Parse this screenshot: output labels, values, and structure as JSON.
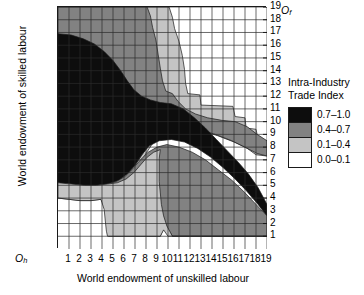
{
  "chart_data": {
    "type": "heatmap",
    "title": "",
    "xlabel": "World endowment of unskilled labour",
    "ylabel": "World endowment of skilled labour",
    "xlim": [
      0,
      19
    ],
    "ylim": [
      0,
      19
    ],
    "xticks": [
      "1",
      "2",
      "3",
      "4",
      "5",
      "6",
      "7",
      "8",
      "9",
      "10",
      "11",
      "12",
      "13",
      "14",
      "15",
      "16",
      "17",
      "18",
      "19"
    ],
    "yticks": [
      "1",
      "2",
      "3",
      "4",
      "5",
      "6",
      "7",
      "8",
      "9",
      "10",
      "11",
      "12",
      "13",
      "14",
      "15",
      "16",
      "17",
      "18",
      "19"
    ],
    "grid": true,
    "origin_left_label": "O",
    "origin_left_sub": "h",
    "origin_right_label": "O",
    "origin_right_sub": "f",
    "legend": {
      "title_line1": "Intra-Industry",
      "title_line2": "Trade Index",
      "position": "right",
      "entries": [
        {
          "label": "0.7–1.0",
          "color": "#0d0d0d"
        },
        {
          "label": "0.4–0.7",
          "color": "#828282"
        },
        {
          "label": "0.1–0.4",
          "color": "#c4c4c4"
        },
        {
          "label": "0.0–0.1",
          "color": "#ffffff"
        }
      ]
    },
    "bands": [
      {
        "name": "band-0.1-0.4-upper",
        "level": "0.1-0.4",
        "color": "#c4c4c4",
        "points": [
          [
            0,
            19
          ],
          [
            10.1,
            19
          ],
          [
            10.4,
            18.2
          ],
          [
            10.6,
            17.3
          ],
          [
            11.0,
            16.3
          ],
          [
            11.3,
            15.2
          ],
          [
            11.5,
            14.1
          ],
          [
            11.6,
            13.0
          ],
          [
            11.8,
            12.2
          ],
          [
            12.9,
            12.1
          ],
          [
            13.0,
            11.3
          ],
          [
            15.9,
            11.2
          ],
          [
            16.1,
            10.4
          ],
          [
            17.0,
            10.3
          ],
          [
            17.1,
            9.5
          ],
          [
            18.0,
            9.4
          ],
          [
            18.2,
            8.6
          ],
          [
            19,
            8.5
          ],
          [
            19,
            7.3
          ],
          [
            18.0,
            7.4
          ],
          [
            17.2,
            7.9
          ],
          [
            16.0,
            8.4
          ],
          [
            14.5,
            8.9
          ],
          [
            13.0,
            9.3
          ],
          [
            11.5,
            9.5
          ],
          [
            10.2,
            9.3
          ],
          [
            9.3,
            8.9
          ],
          [
            8.6,
            8.3
          ],
          [
            8.0,
            7.5
          ],
          [
            7.4,
            6.6
          ],
          [
            6.7,
            5.9
          ],
          [
            5.9,
            5.4
          ],
          [
            5.0,
            5.1
          ],
          [
            4.0,
            5.0
          ],
          [
            3.0,
            5.0
          ],
          [
            2.0,
            5.1
          ],
          [
            1.0,
            5.2
          ],
          [
            0,
            5.3
          ]
        ]
      },
      {
        "name": "band-0.4-0.7-upper",
        "level": "0.4-0.7",
        "color": "#828282",
        "points": [
          [
            0,
            19
          ],
          [
            8.1,
            19
          ],
          [
            8.4,
            18.3
          ],
          [
            8.6,
            17.4
          ],
          [
            8.9,
            16.4
          ],
          [
            9.1,
            15.3
          ],
          [
            9.3,
            14.2
          ],
          [
            9.5,
            13.2
          ],
          [
            9.8,
            12.4
          ],
          [
            10.4,
            12.2
          ],
          [
            10.9,
            11.6
          ],
          [
            11.6,
            11.0
          ],
          [
            12.5,
            10.6
          ],
          [
            13.6,
            10.3
          ],
          [
            14.9,
            10.1
          ],
          [
            16.1,
            10.0
          ],
          [
            17.2,
            9.6
          ],
          [
            18.1,
            9.0
          ],
          [
            19,
            8.5
          ],
          [
            19,
            7.3
          ],
          [
            18.1,
            7.5
          ],
          [
            17.0,
            8.0
          ],
          [
            15.8,
            8.5
          ],
          [
            14.3,
            9.0
          ],
          [
            12.8,
            9.4
          ],
          [
            11.4,
            9.6
          ],
          [
            10.1,
            9.4
          ],
          [
            9.2,
            9.0
          ],
          [
            8.4,
            8.4
          ],
          [
            7.8,
            7.6
          ],
          [
            7.1,
            6.7
          ],
          [
            6.4,
            6.0
          ],
          [
            5.6,
            5.5
          ],
          [
            4.7,
            5.2
          ],
          [
            3.7,
            5.1
          ],
          [
            2.6,
            5.1
          ],
          [
            1.4,
            5.2
          ],
          [
            0,
            5.4
          ]
        ]
      },
      {
        "name": "band-0.7-1.0-black",
        "level": "0.7-1.0",
        "color": "#0d0d0d",
        "points": [
          [
            0,
            16.9
          ],
          [
            1.2,
            16.8
          ],
          [
            2.3,
            16.5
          ],
          [
            3.3,
            16.1
          ],
          [
            4.2,
            15.5
          ],
          [
            5.0,
            14.8
          ],
          [
            5.7,
            14.0
          ],
          [
            6.3,
            13.2
          ],
          [
            6.9,
            12.5
          ],
          [
            7.6,
            12.0
          ],
          [
            8.4,
            11.7
          ],
          [
            9.3,
            11.5
          ],
          [
            10.3,
            11.4
          ],
          [
            11.4,
            11.0
          ],
          [
            12.4,
            10.3
          ],
          [
            13.4,
            9.5
          ],
          [
            14.4,
            8.6
          ],
          [
            15.4,
            7.7
          ],
          [
            16.4,
            6.8
          ],
          [
            17.3,
            5.9
          ],
          [
            18.2,
            4.8
          ],
          [
            19,
            3.5
          ],
          [
            19,
            2.6
          ],
          [
            18.1,
            3.6
          ],
          [
            17.1,
            4.6
          ],
          [
            16.1,
            5.5
          ],
          [
            15.0,
            6.4
          ],
          [
            13.9,
            7.2
          ],
          [
            12.7,
            7.9
          ],
          [
            11.5,
            8.4
          ],
          [
            10.3,
            8.6
          ],
          [
            9.2,
            8.5
          ],
          [
            8.3,
            8.1
          ],
          [
            7.6,
            7.4
          ],
          [
            7.0,
            6.6
          ],
          [
            6.3,
            5.9
          ],
          [
            5.5,
            5.4
          ],
          [
            4.6,
            5.1
          ],
          [
            3.6,
            5.0
          ],
          [
            2.5,
            5.0
          ],
          [
            1.3,
            5.1
          ],
          [
            0,
            5.2
          ]
        ]
      },
      {
        "name": "band-0.4-0.7-lower",
        "level": "0.4-0.7",
        "color": "#828282",
        "points": [
          [
            19,
            2.6
          ],
          [
            18.0,
            3.5
          ],
          [
            16.9,
            4.5
          ],
          [
            15.8,
            5.4
          ],
          [
            14.6,
            6.2
          ],
          [
            13.4,
            7.0
          ],
          [
            12.2,
            7.6
          ],
          [
            11.0,
            8.0
          ],
          [
            9.9,
            8.2
          ],
          [
            9.0,
            8.0
          ],
          [
            8.2,
            7.6
          ],
          [
            7.5,
            7.0
          ],
          [
            6.8,
            6.3
          ],
          [
            6.1,
            5.7
          ],
          [
            5.3,
            5.3
          ],
          [
            4.4,
            5.1
          ],
          [
            3.4,
            5.0
          ],
          [
            2.3,
            5.0
          ],
          [
            1.1,
            5.1
          ],
          [
            0,
            5.2
          ],
          [
            0,
            4.0
          ],
          [
            1.0,
            3.9
          ],
          [
            2.0,
            3.8
          ],
          [
            3.0,
            3.8
          ],
          [
            3.9,
            3.9
          ],
          [
            4.3,
            3.2
          ],
          [
            4.4,
            2.3
          ],
          [
            4.5,
            1.5
          ],
          [
            4.6,
            1.0
          ],
          [
            9.3,
            1.0
          ],
          [
            9.5,
            1.4
          ],
          [
            9.8,
            1.9
          ],
          [
            10.4,
            1.0
          ],
          [
            19,
            1.0
          ]
        ]
      },
      {
        "name": "band-0.1-0.4-lower",
        "level": "0.1-0.4",
        "color": "#c4c4c4",
        "points": [
          [
            19,
            1.0
          ],
          [
            10.4,
            1.0
          ],
          [
            9.9,
            1.8
          ],
          [
            9.6,
            2.6
          ],
          [
            9.4,
            3.5
          ],
          [
            9.3,
            4.4
          ],
          [
            9.2,
            5.3
          ],
          [
            9.2,
            6.2
          ],
          [
            9.2,
            7.1
          ],
          [
            9.3,
            7.8
          ],
          [
            8.7,
            7.6
          ],
          [
            8.1,
            7.2
          ],
          [
            7.5,
            6.6
          ],
          [
            6.9,
            6.0
          ],
          [
            6.2,
            5.5
          ],
          [
            5.4,
            5.2
          ],
          [
            4.5,
            5.1
          ],
          [
            3.5,
            5.0
          ],
          [
            2.4,
            5.0
          ],
          [
            1.2,
            5.1
          ],
          [
            0,
            5.2
          ],
          [
            0,
            4.0
          ],
          [
            1.0,
            3.9
          ],
          [
            2.0,
            3.8
          ],
          [
            3.0,
            3.8
          ],
          [
            3.9,
            3.9
          ],
          [
            4.2,
            3.1
          ],
          [
            4.3,
            2.2
          ],
          [
            4.4,
            1.4
          ],
          [
            4.5,
            1.0
          ],
          [
            9.3,
            1.0
          ],
          [
            9.6,
            1.5
          ],
          [
            10.0,
            1.0
          ]
        ]
      }
    ]
  }
}
